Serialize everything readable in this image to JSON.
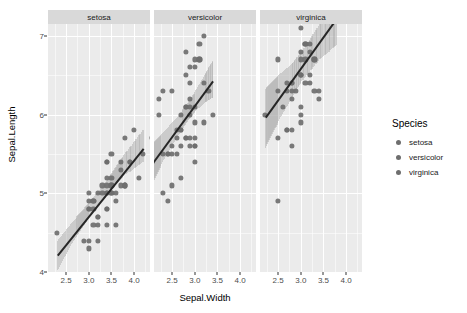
{
  "chart_data": {
    "type": "scatter",
    "title": "",
    "xlabel": "Sepal.Width",
    "ylabel": "Sepal.Length",
    "xlim": [
      2.1,
      4.35
    ],
    "ylim": [
      4.0,
      7.15
    ],
    "xticks": [
      "2.5",
      "3.0",
      "3.5",
      "4.0"
    ],
    "xtick_values": [
      2.5,
      3.0,
      3.5,
      4.0
    ],
    "yticks": [
      "4",
      "5",
      "6",
      "7"
    ],
    "ytick_values": [
      4,
      5,
      6,
      7
    ],
    "grid": true,
    "facet_by": "Species",
    "legend": {
      "title": "Species",
      "position": "right",
      "entries": [
        "setosa",
        "versicolor",
        "virginica"
      ]
    },
    "smooth": {
      "method": "lm",
      "show_confidence_band": true,
      "line_color": "#262626",
      "band_color": "#b0b0b0"
    },
    "point_color": "#6e6e6e",
    "panel_background": "#ebebeb",
    "gridline_color": "#ffffff",
    "strip_background": "#d9d9d9",
    "facets": [
      {
        "label": "setosa",
        "fit_line": {
          "x0": 2.3,
          "y0": 4.22,
          "x1": 4.2,
          "y1": 5.58
        },
        "band": [
          {
            "x": 2.3,
            "lo": 4.02,
            "hi": 4.4
          },
          {
            "x": 2.6,
            "lo": 4.35,
            "hi": 4.62
          },
          {
            "x": 2.9,
            "lo": 4.62,
            "hi": 4.82
          },
          {
            "x": 3.2,
            "lo": 4.86,
            "hi": 5.03
          },
          {
            "x": 3.5,
            "lo": 5.07,
            "hi": 5.26
          },
          {
            "x": 3.8,
            "lo": 5.24,
            "hi": 5.52
          },
          {
            "x": 4.2,
            "lo": 5.41,
            "hi": 5.82
          }
        ],
        "points": [
          [
            3.5,
            5.1
          ],
          [
            3.0,
            4.9
          ],
          [
            3.2,
            4.7
          ],
          [
            3.1,
            4.6
          ],
          [
            3.6,
            5.0
          ],
          [
            3.9,
            5.4
          ],
          [
            3.4,
            4.6
          ],
          [
            3.4,
            5.0
          ],
          [
            2.9,
            4.4
          ],
          [
            3.1,
            4.9
          ],
          [
            3.7,
            5.4
          ],
          [
            3.4,
            4.8
          ],
          [
            3.0,
            4.8
          ],
          [
            3.0,
            4.3
          ],
          [
            4.0,
            5.8
          ],
          [
            4.4,
            5.7
          ],
          [
            3.9,
            5.4
          ],
          [
            3.5,
            5.1
          ],
          [
            3.8,
            5.7
          ],
          [
            3.8,
            5.1
          ],
          [
            3.4,
            5.4
          ],
          [
            3.7,
            5.1
          ],
          [
            3.6,
            4.6
          ],
          [
            3.3,
            5.1
          ],
          [
            3.4,
            4.8
          ],
          [
            3.0,
            5.0
          ],
          [
            3.4,
            5.0
          ],
          [
            3.5,
            5.2
          ],
          [
            3.4,
            5.2
          ],
          [
            3.2,
            4.7
          ],
          [
            3.1,
            4.8
          ],
          [
            3.4,
            5.4
          ],
          [
            4.1,
            5.2
          ],
          [
            4.2,
            5.5
          ],
          [
            3.1,
            4.9
          ],
          [
            3.2,
            5.0
          ],
          [
            3.5,
            5.5
          ],
          [
            3.6,
            4.9
          ],
          [
            3.0,
            4.4
          ],
          [
            3.4,
            5.1
          ],
          [
            3.5,
            5.0
          ],
          [
            2.3,
            4.5
          ],
          [
            3.2,
            4.4
          ],
          [
            3.5,
            5.0
          ],
          [
            3.8,
            5.1
          ],
          [
            3.0,
            4.8
          ],
          [
            3.8,
            5.1
          ],
          [
            3.2,
            4.6
          ],
          [
            3.7,
            5.3
          ],
          [
            3.3,
            5.0
          ]
        ]
      },
      {
        "label": "versicolor",
        "fit_line": {
          "x0": 2.0,
          "y0": 5.33,
          "x1": 3.4,
          "y1": 6.43
        },
        "band": [
          {
            "x": 2.0,
            "lo": 5.07,
            "hi": 5.6
          },
          {
            "x": 2.3,
            "lo": 5.42,
            "hi": 5.78
          },
          {
            "x": 2.6,
            "lo": 5.72,
            "hi": 5.97
          },
          {
            "x": 2.9,
            "lo": 5.98,
            "hi": 6.2
          },
          {
            "x": 3.2,
            "lo": 6.15,
            "hi": 6.5
          },
          {
            "x": 3.4,
            "lo": 6.22,
            "hi": 6.7
          }
        ],
        "points": [
          [
            3.2,
            7.0
          ],
          [
            3.2,
            6.4
          ],
          [
            3.1,
            6.9
          ],
          [
            2.3,
            5.5
          ],
          [
            2.8,
            6.5
          ],
          [
            2.8,
            5.7
          ],
          [
            3.3,
            6.3
          ],
          [
            2.4,
            4.9
          ],
          [
            2.9,
            6.6
          ],
          [
            2.7,
            5.2
          ],
          [
            2.0,
            5.0
          ],
          [
            3.0,
            5.9
          ],
          [
            2.2,
            6.0
          ],
          [
            2.9,
            6.1
          ],
          [
            2.9,
            5.6
          ],
          [
            3.1,
            6.7
          ],
          [
            3.0,
            5.6
          ],
          [
            2.7,
            5.8
          ],
          [
            2.2,
            6.2
          ],
          [
            2.5,
            5.6
          ],
          [
            3.2,
            5.9
          ],
          [
            2.8,
            6.1
          ],
          [
            2.5,
            6.3
          ],
          [
            2.8,
            6.1
          ],
          [
            2.9,
            6.4
          ],
          [
            3.0,
            6.6
          ],
          [
            2.8,
            6.8
          ],
          [
            3.0,
            6.7
          ],
          [
            2.9,
            6.0
          ],
          [
            2.6,
            5.7
          ],
          [
            2.4,
            5.5
          ],
          [
            2.4,
            5.5
          ],
          [
            2.7,
            5.8
          ],
          [
            2.7,
            6.0
          ],
          [
            3.0,
            5.4
          ],
          [
            3.4,
            6.0
          ],
          [
            3.1,
            6.7
          ],
          [
            2.3,
            6.3
          ],
          [
            3.0,
            5.6
          ],
          [
            2.5,
            5.5
          ],
          [
            2.6,
            5.5
          ],
          [
            3.0,
            6.1
          ],
          [
            2.6,
            5.8
          ],
          [
            2.3,
            5.0
          ],
          [
            2.7,
            5.6
          ],
          [
            3.0,
            5.7
          ],
          [
            2.9,
            5.7
          ],
          [
            2.9,
            6.2
          ],
          [
            2.5,
            5.1
          ],
          [
            2.8,
            5.7
          ]
        ]
      },
      {
        "label": "virginica",
        "fit_line": {
          "x0": 2.2,
          "y0": 5.97,
          "x1": 3.8,
          "y1": 7.25
        },
        "band": [
          {
            "x": 2.2,
            "lo": 5.58,
            "hi": 6.33
          },
          {
            "x": 2.5,
            "lo": 5.92,
            "hi": 6.5
          },
          {
            "x": 2.8,
            "lo": 6.22,
            "hi": 6.65
          },
          {
            "x": 3.0,
            "lo": 6.42,
            "hi": 6.8
          },
          {
            "x": 3.4,
            "lo": 6.7,
            "hi": 7.15
          },
          {
            "x": 3.8,
            "lo": 6.9,
            "hi": 7.15
          }
        ],
        "points": [
          [
            3.3,
            6.3
          ],
          [
            2.7,
            5.8
          ],
          [
            3.0,
            7.1
          ],
          [
            2.9,
            6.3
          ],
          [
            3.0,
            6.5
          ],
          [
            3.0,
            7.6
          ],
          [
            2.5,
            4.9
          ],
          [
            2.9,
            7.3
          ],
          [
            2.5,
            6.7
          ],
          [
            3.6,
            7.2
          ],
          [
            3.2,
            6.5
          ],
          [
            2.7,
            6.4
          ],
          [
            3.0,
            6.8
          ],
          [
            2.5,
            5.7
          ],
          [
            2.8,
            5.8
          ],
          [
            3.2,
            6.4
          ],
          [
            3.0,
            6.5
          ],
          [
            3.8,
            7.7
          ],
          [
            2.6,
            7.7
          ],
          [
            2.2,
            6.0
          ],
          [
            3.2,
            6.9
          ],
          [
            2.8,
            5.6
          ],
          [
            2.8,
            7.7
          ],
          [
            2.7,
            6.3
          ],
          [
            3.3,
            6.7
          ],
          [
            3.2,
            7.2
          ],
          [
            2.8,
            6.2
          ],
          [
            3.0,
            6.1
          ],
          [
            2.8,
            6.4
          ],
          [
            3.0,
            7.2
          ],
          [
            2.8,
            7.4
          ],
          [
            3.8,
            7.9
          ],
          [
            2.8,
            6.4
          ],
          [
            2.8,
            6.3
          ],
          [
            2.6,
            6.1
          ],
          [
            3.0,
            7.7
          ],
          [
            3.4,
            6.3
          ],
          [
            3.1,
            6.4
          ],
          [
            3.0,
            6.0
          ],
          [
            3.1,
            6.9
          ],
          [
            3.1,
            6.7
          ],
          [
            3.1,
            6.9
          ],
          [
            2.7,
            5.8
          ],
          [
            3.2,
            6.8
          ],
          [
            3.3,
            6.7
          ],
          [
            3.0,
            6.7
          ],
          [
            2.5,
            6.3
          ],
          [
            3.0,
            6.5
          ],
          [
            3.4,
            6.2
          ],
          [
            3.0,
            5.9
          ]
        ]
      }
    ]
  }
}
